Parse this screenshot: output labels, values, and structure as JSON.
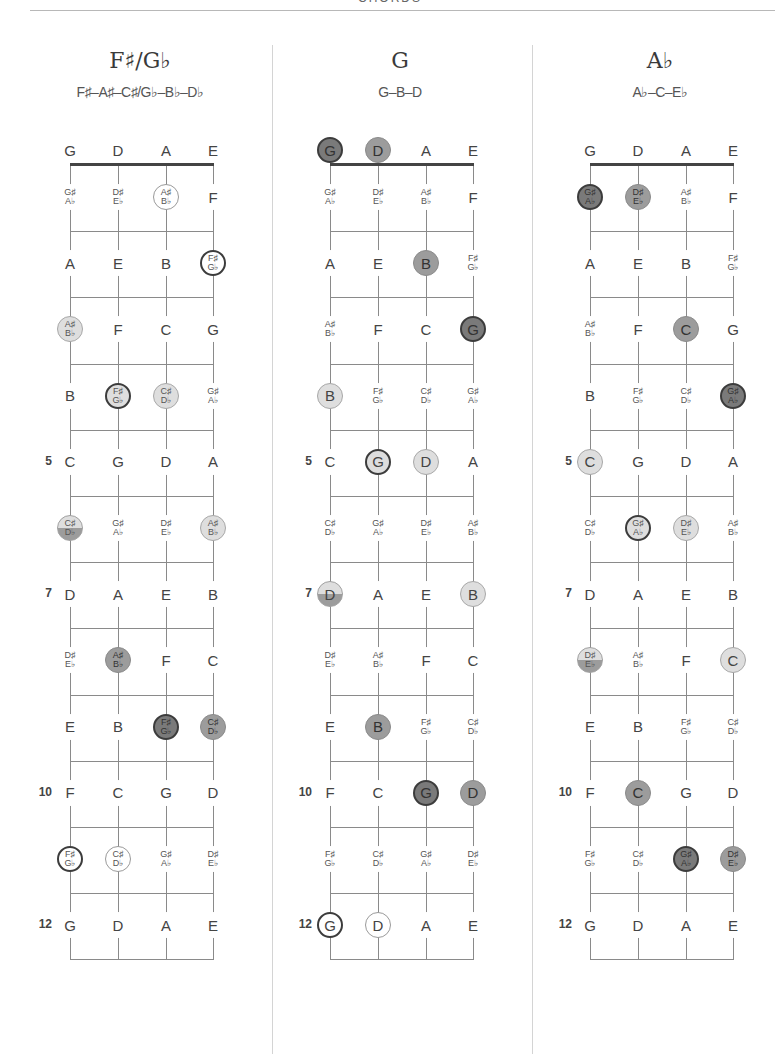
{
  "page": {
    "header": "CHORDS"
  },
  "layout": {
    "strings_open": [
      "G",
      "D",
      "A",
      "E"
    ],
    "fret_markers": [
      5,
      7,
      10,
      12
    ]
  },
  "fretboard_notes": [
    [
      "G",
      "D",
      "A",
      "E"
    ],
    [
      "G♯/A♭",
      "D♯/E♭",
      "A♯/B♭",
      "F"
    ],
    [
      "A",
      "E",
      "B",
      "F♯/G♭"
    ],
    [
      "A♯/B♭",
      "F",
      "C",
      "G"
    ],
    [
      "B",
      "F♯/G♭",
      "C♯/D♭",
      "G♯/A♭"
    ],
    [
      "C",
      "G",
      "D",
      "A"
    ],
    [
      "C♯/D♭",
      "G♯/A♭",
      "D♯/E♭",
      "A♯/B♭"
    ],
    [
      "D",
      "A",
      "E",
      "B"
    ],
    [
      "D♯/E♭",
      "A♯/B♭",
      "F",
      "C"
    ],
    [
      "E",
      "B",
      "F♯/G♭",
      "C♯/D♭"
    ],
    [
      "F",
      "C",
      "G",
      "D"
    ],
    [
      "F♯/G♭",
      "C♯/D♭",
      "G♯/A♭",
      "D♯/E♭"
    ],
    [
      "G",
      "D",
      "A",
      "E"
    ]
  ],
  "chords": [
    {
      "name": "F♯/G♭",
      "notes": "F♯–A♯–C♯/G♭–B♭–D♭",
      "highlights": [
        {
          "fret": 1,
          "string": 2,
          "style": "outline"
        },
        {
          "fret": 2,
          "string": 3,
          "style": "outline-dark"
        },
        {
          "fret": 3,
          "string": 0,
          "style": "light"
        },
        {
          "fret": 4,
          "string": 1,
          "style": "light-dark"
        },
        {
          "fret": 4,
          "string": 2,
          "style": "light"
        },
        {
          "fret": 6,
          "string": 0,
          "style": "split"
        },
        {
          "fret": 6,
          "string": 3,
          "style": "light"
        },
        {
          "fret": 8,
          "string": 1,
          "style": "medium"
        },
        {
          "fret": 9,
          "string": 2,
          "style": "dark"
        },
        {
          "fret": 9,
          "string": 3,
          "style": "medium"
        },
        {
          "fret": 11,
          "string": 0,
          "style": "outline-dark"
        },
        {
          "fret": 11,
          "string": 1,
          "style": "outline"
        }
      ]
    },
    {
      "name": "G",
      "notes": "G–B–D",
      "highlights": [
        {
          "fret": 0,
          "string": 0,
          "style": "dark"
        },
        {
          "fret": 0,
          "string": 1,
          "style": "medium"
        },
        {
          "fret": 2,
          "string": 2,
          "style": "medium"
        },
        {
          "fret": 3,
          "string": 3,
          "style": "dark"
        },
        {
          "fret": 4,
          "string": 0,
          "style": "light"
        },
        {
          "fret": 5,
          "string": 1,
          "style": "light-dark"
        },
        {
          "fret": 5,
          "string": 2,
          "style": "light"
        },
        {
          "fret": 7,
          "string": 0,
          "style": "split"
        },
        {
          "fret": 7,
          "string": 3,
          "style": "light"
        },
        {
          "fret": 9,
          "string": 1,
          "style": "medium"
        },
        {
          "fret": 10,
          "string": 2,
          "style": "dark"
        },
        {
          "fret": 10,
          "string": 3,
          "style": "medium"
        },
        {
          "fret": 12,
          "string": 0,
          "style": "outline-dark"
        },
        {
          "fret": 12,
          "string": 1,
          "style": "outline"
        }
      ]
    },
    {
      "name": "A♭",
      "notes": "A♭–C–E♭",
      "highlights": [
        {
          "fret": 1,
          "string": 0,
          "style": "dark"
        },
        {
          "fret": 1,
          "string": 1,
          "style": "medium"
        },
        {
          "fret": 3,
          "string": 2,
          "style": "medium"
        },
        {
          "fret": 4,
          "string": 3,
          "style": "dark"
        },
        {
          "fret": 5,
          "string": 0,
          "style": "light"
        },
        {
          "fret": 6,
          "string": 1,
          "style": "light-dark"
        },
        {
          "fret": 6,
          "string": 2,
          "style": "light"
        },
        {
          "fret": 8,
          "string": 0,
          "style": "split"
        },
        {
          "fret": 8,
          "string": 3,
          "style": "light"
        },
        {
          "fret": 10,
          "string": 1,
          "style": "medium"
        },
        {
          "fret": 11,
          "string": 2,
          "style": "dark"
        },
        {
          "fret": 11,
          "string": 3,
          "style": "medium"
        }
      ]
    }
  ]
}
